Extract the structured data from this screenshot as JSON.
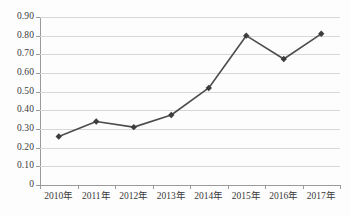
{
  "chart_data": {
    "type": "line",
    "title": "",
    "subtitle": "",
    "xlabel": "",
    "ylabel": "",
    "categories": [
      "2010年",
      "2011年",
      "2012年",
      "2013年",
      "2014年",
      "2015年",
      "2016年",
      "2017年"
    ],
    "values": [
      0.26,
      0.34,
      0.31,
      0.375,
      0.52,
      0.8,
      0.675,
      0.81
    ],
    "series": [
      {
        "name": "",
        "values": [
          0.26,
          0.34,
          0.31,
          0.375,
          0.52,
          0.8,
          0.675,
          0.81
        ]
      }
    ],
    "ylim": [
      0,
      0.9
    ],
    "y_ticks": [
      0.9,
      0.8,
      0.7,
      0.6,
      0.5,
      0.4,
      0.3,
      0.2,
      0.1,
      0
    ],
    "y_tick_labels": [
      "0.90",
      "0.80",
      "0.70",
      "0.60",
      "0.50",
      "0.40",
      "0.30",
      "0.20",
      "0.10",
      "0"
    ],
    "x_tick_labels": [
      "2010年",
      "2011年",
      "2012年",
      "2013年",
      "2014年",
      "2015年",
      "2016年",
      "2017年"
    ],
    "grid": true,
    "grid_axis": "y",
    "legend": false,
    "legend_position": "none",
    "marker": "diamond",
    "line_color": "#4d4d4d",
    "marker_color": "#3d3d3d",
    "grid_color": "#d7d7d7",
    "axis_color": "#9a9a9a",
    "background_color": "#fdfdfd",
    "text_color": "#3a3a3a"
  }
}
